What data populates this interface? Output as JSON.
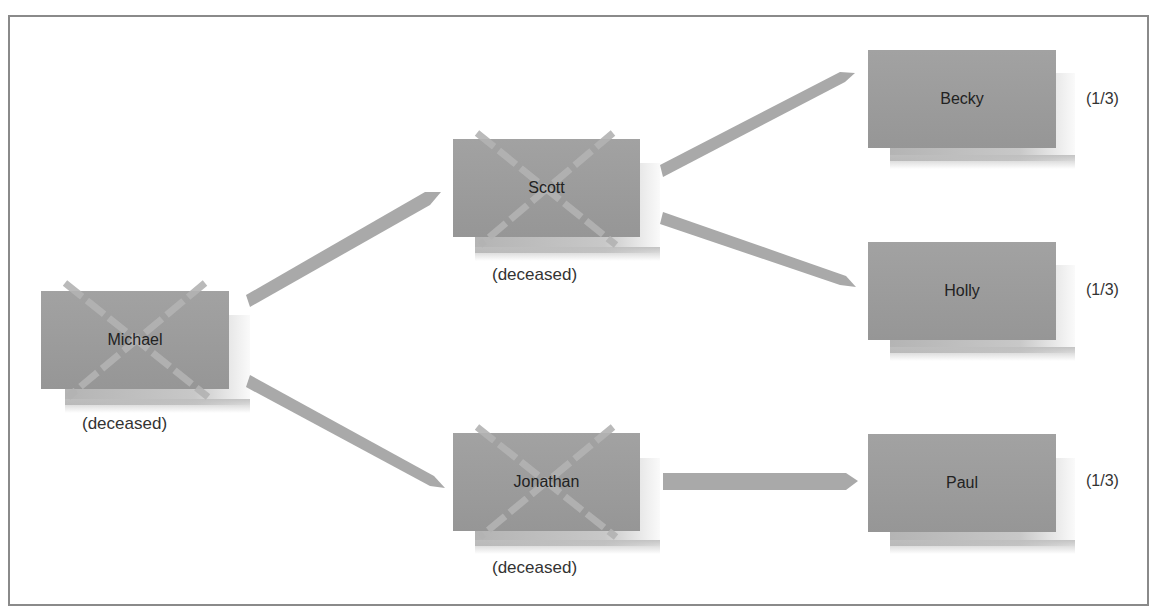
{
  "diagram": {
    "title": "",
    "nodes": [
      {
        "id": "michael",
        "name": "Michael",
        "status": "(deceased)",
        "deceased": true,
        "share": ""
      },
      {
        "id": "scott",
        "name": "Scott",
        "status": "(deceased)",
        "deceased": true,
        "share": ""
      },
      {
        "id": "jonathan",
        "name": "Jonathan",
        "status": "(deceased)",
        "deceased": true,
        "share": ""
      },
      {
        "id": "becky",
        "name": "Becky",
        "status": "",
        "deceased": false,
        "share": "(1/3)"
      },
      {
        "id": "holly",
        "name": "Holly",
        "status": "",
        "deceased": false,
        "share": "(1/3)"
      },
      {
        "id": "paul",
        "name": "Paul",
        "status": "",
        "deceased": false,
        "share": "(1/3)"
      }
    ],
    "edges": [
      {
        "from": "michael",
        "to": "scott"
      },
      {
        "from": "michael",
        "to": "jonathan"
      },
      {
        "from": "scott",
        "to": "becky"
      },
      {
        "from": "scott",
        "to": "holly"
      },
      {
        "from": "jonathan",
        "to": "paul"
      }
    ],
    "colors": {
      "box": "#9c9c9c",
      "arrow": "#a8a8a8",
      "cross": "#b8b8b8",
      "border": "#8a8a8a"
    }
  }
}
